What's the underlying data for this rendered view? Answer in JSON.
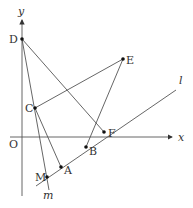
{
  "diagram": {
    "axes": {
      "x_label": "x",
      "y_label": "y",
      "origin_label": "O"
    },
    "lines": {
      "l_label": "l",
      "m_label": "m"
    },
    "points": {
      "A": "A",
      "B": "B",
      "C": "C",
      "D": "D",
      "E": "E",
      "F": "F",
      "M": "M"
    },
    "segments": [
      "DF",
      "DA",
      "CE",
      "EB",
      "CA"
    ],
    "colors": {
      "line": "#555555",
      "point": "#111111",
      "text": "#333333"
    }
  }
}
